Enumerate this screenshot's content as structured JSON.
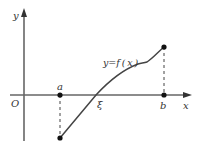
{
  "diagram": {
    "axes": {
      "x_label": "x",
      "y_label": "y",
      "origin_label": "O"
    },
    "points": {
      "a_label": "a",
      "b_label": "b",
      "xi_label": "ξ"
    },
    "curve_label": "y=f ( x )",
    "colors": {
      "axis": "#555555",
      "curve": "#444444",
      "point": "#111111",
      "dashed": "#444444",
      "text": "#333333"
    }
  }
}
